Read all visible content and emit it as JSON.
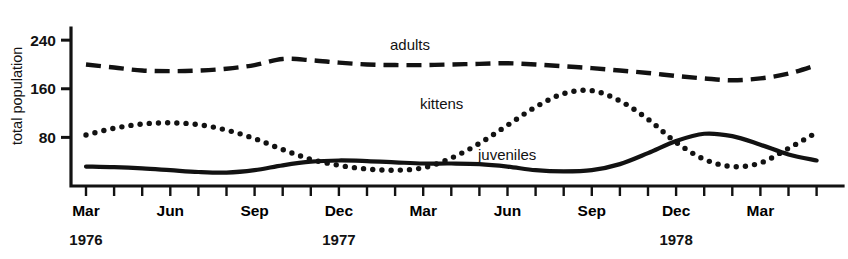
{
  "chart_data": {
    "type": "line",
    "title": "",
    "xlabel": "",
    "ylabel": "total population",
    "ylim": [
      0,
      260
    ],
    "yticks": [
      80,
      160,
      240
    ],
    "ytick_labels": [
      "80",
      "160",
      "240"
    ],
    "grid": false,
    "legend": "inline-annotations",
    "x_axis": {
      "tick_labels": [
        "Mar",
        "",
        "",
        "Jun",
        "",
        "",
        "Sep",
        "",
        "",
        "Dec",
        "",
        "",
        "Mar",
        "",
        "",
        "Jun",
        "",
        "",
        "Sep",
        "",
        "",
        "Dec",
        "",
        "",
        "Mar",
        "",
        ""
      ],
      "year_markers": [
        {
          "label": "1976",
          "at_tick": 0
        },
        {
          "label": "1977",
          "at_tick": 9
        },
        {
          "label": "1978",
          "at_tick": 21
        }
      ],
      "tick_count": 27
    },
    "series": [
      {
        "name": "adults",
        "style": "dashed",
        "label": "adults",
        "x": [
          0,
          1,
          2,
          3,
          4,
          5,
          6,
          7,
          8,
          9,
          10,
          11,
          12,
          13,
          14,
          15,
          16,
          17,
          18,
          19,
          20,
          21,
          22,
          23,
          24,
          25,
          26
        ],
        "values": [
          200,
          195,
          190,
          189,
          190,
          193,
          199,
          209,
          207,
          203,
          200,
          199,
          199,
          200,
          201,
          202,
          200,
          197,
          194,
          190,
          186,
          181,
          177,
          174,
          177,
          185,
          199
        ]
      },
      {
        "name": "kittens",
        "style": "dotted",
        "label": "kittens",
        "x": [
          0,
          1,
          2,
          3,
          4,
          5,
          6,
          7,
          8,
          9,
          10,
          11,
          12,
          13,
          14,
          15,
          16,
          17,
          18,
          19,
          20,
          21,
          22,
          23,
          24,
          25,
          26
        ],
        "values": [
          84,
          95,
          102,
          104,
          101,
          92,
          78,
          60,
          44,
          34,
          28,
          26,
          30,
          46,
          70,
          100,
          130,
          152,
          157,
          140,
          110,
          72,
          44,
          32,
          38,
          62,
          88
        ]
      },
      {
        "name": "juveniles",
        "style": "solid",
        "label": "juveniles",
        "x": [
          0,
          1,
          2,
          3,
          4,
          5,
          6,
          7,
          8,
          9,
          10,
          11,
          12,
          13,
          14,
          15,
          16,
          17,
          18,
          19,
          20,
          21,
          22,
          23,
          24,
          25,
          26
        ],
        "values": [
          32,
          31,
          29,
          26,
          23,
          22,
          26,
          34,
          40,
          42,
          41,
          39,
          37,
          37,
          36,
          32,
          26,
          24,
          26,
          36,
          54,
          74,
          86,
          82,
          68,
          52,
          42
        ]
      }
    ],
    "annotations": [
      {
        "text": "adults",
        "x_px": 390,
        "y_px": 50
      },
      {
        "text": "kittens",
        "x_px": 420,
        "y_px": 109
      },
      {
        "text": "juveniles",
        "x_px": 478,
        "y_px": 160
      }
    ]
  }
}
